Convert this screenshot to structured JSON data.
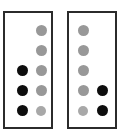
{
  "figure": {
    "background_color": "#ffffff",
    "panel_border_color": "#2b2b2b",
    "gray_dot_color": "#989898",
    "black_dot_color": "#0d0d0d",
    "panel_count": 2,
    "rows": 5,
    "columns": 2
  },
  "chart_data": {
    "type": "scatter",
    "title": "",
    "xlabel": "",
    "ylabel": "",
    "grid": false,
    "legend": "none",
    "panels": [
      {
        "name": "left-panel",
        "columns": [
          "col-1",
          "col-2"
        ],
        "rows": [
          "row-1",
          "row-2",
          "row-3",
          "row-4",
          "row-5"
        ],
        "markers": [
          {
            "row": 1,
            "column": 2,
            "color": "#989898",
            "state": "gray"
          },
          {
            "row": 2,
            "column": 2,
            "color": "#989898",
            "state": "gray"
          },
          {
            "row": 3,
            "column": 1,
            "color": "#0d0d0d",
            "state": "black"
          },
          {
            "row": 3,
            "column": 2,
            "color": "#989898",
            "state": "gray"
          },
          {
            "row": 4,
            "column": 1,
            "color": "#0d0d0d",
            "state": "black"
          },
          {
            "row": 4,
            "column": 2,
            "color": "#989898",
            "state": "gray"
          },
          {
            "row": 5,
            "column": 1,
            "color": "#0d0d0d",
            "state": "black"
          },
          {
            "row": 5,
            "column": 2,
            "color": "#a8a8a8",
            "state": "gray-light"
          }
        ],
        "gray_count": 5,
        "black_count": 3
      },
      {
        "name": "right-panel",
        "columns": [
          "col-1",
          "col-2"
        ],
        "rows": [
          "row-1",
          "row-2",
          "row-3",
          "row-4",
          "row-5"
        ],
        "markers": [
          {
            "row": 1,
            "column": 1,
            "color": "#989898",
            "state": "gray"
          },
          {
            "row": 2,
            "column": 1,
            "color": "#989898",
            "state": "gray"
          },
          {
            "row": 3,
            "column": 1,
            "color": "#989898",
            "state": "gray"
          },
          {
            "row": 4,
            "column": 1,
            "color": "#989898",
            "state": "gray"
          },
          {
            "row": 4,
            "column": 2,
            "color": "#0d0d0d",
            "state": "black"
          },
          {
            "row": 5,
            "column": 1,
            "color": "#a8a8a8",
            "state": "gray-light"
          },
          {
            "row": 5,
            "column": 2,
            "color": "#0d0d0d",
            "state": "black"
          }
        ],
        "gray_count": 5,
        "black_count": 2
      }
    ]
  }
}
